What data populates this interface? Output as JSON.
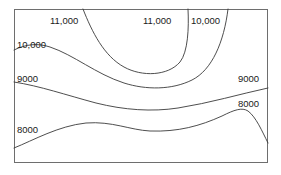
{
  "figure": {
    "width": 281,
    "height": 175,
    "background_color": "#ffffff",
    "frame": {
      "x": 14,
      "y": 9,
      "width": 254,
      "height": 154,
      "stroke_color": "#6e6e6e"
    }
  },
  "chart_data": {
    "type": "line",
    "chart_subtype": "contour-map",
    "title": "",
    "xlabel": "",
    "ylabel": "",
    "grid": false,
    "legend": "none",
    "axis_ticks": "none",
    "contour_line_color": "#3a3a3a",
    "contour_levels": [
      8000,
      9000,
      10000,
      11000
    ],
    "contour_level_labels": [
      "8000",
      "9000",
      "10,000",
      "11,000"
    ],
    "contours": [
      {
        "level": 11000,
        "label": "11,000",
        "shape": "open-u-loop",
        "description": "U-shaped contour open at the top; both branches exit the top edge",
        "enters": "top edge at x=83",
        "exits": "top edge at x=188",
        "trough_point": {
          "x": 150,
          "y": 71
        },
        "path": "M 83 9 C 92 32, 104 56, 124 67 C 142 77, 168 76, 180 62 C 188 52, 189 28, 188 9"
      },
      {
        "level": 10000,
        "label": "10,000",
        "shape": "descending-trough",
        "description": "Enters the left edge, descends to a broad trough across the middle, then rises steeply to exit the top edge on the right",
        "enters": "left edge at y=50",
        "exits": "top edge at x=228",
        "trough_point": {
          "x": 150,
          "y": 88
        },
        "path": "M 14 50 C 26 44, 38 43, 50 47 C 74 55, 96 74, 124 83 C 146 90, 172 90, 192 80 C 212 70, 224 42, 228 9"
      },
      {
        "level": 9000,
        "label": "9000",
        "shape": "gentle-descent",
        "description": "Runs left to right across the figure, sloping gently downward then flattening and rising slightly at the right edge",
        "enters": "left edge at y=82",
        "exits": "right edge at y=88",
        "path": "M 14 82 C 40 86, 66 95, 96 103 C 124 110, 152 112, 178 108 C 210 103, 240 94, 268 88"
      },
      {
        "level": 8000,
        "label": "8000",
        "shape": "wave-with-peak",
        "description": "Rises from the lower-left, forms a gentle crest, dips, then rises to a sharp peak near the right before dropping to the right edge",
        "enters": "left edge at y=148",
        "exits": "right edge at y=143",
        "crest_point": {
          "x": 86,
          "y": 123
        },
        "dip_point": {
          "x": 150,
          "y": 131
        },
        "peak_point": {
          "x": 245,
          "y": 110
        },
        "path": "M 14 148 C 34 140, 58 126, 86 123 C 112 121, 130 130, 150 131 C 178 132, 200 126, 222 116 C 234 110, 242 107, 248 111 C 256 117, 262 131, 268 143"
      }
    ],
    "labels": [
      {
        "text": "11,000",
        "level": 11000,
        "x": 50,
        "y": 21,
        "position": "top-left",
        "anchor": "start"
      },
      {
        "text": "11,000",
        "level": 11000,
        "x": 143,
        "y": 21,
        "position": "top-center",
        "anchor": "start"
      },
      {
        "text": "10,000",
        "level": 10000,
        "x": 191,
        "y": 21,
        "position": "top-right",
        "anchor": "start"
      },
      {
        "text": "10,000",
        "level": 10000,
        "x": 17,
        "y": 45,
        "position": "left-upper",
        "anchor": "start"
      },
      {
        "text": "9000",
        "level": 9000,
        "x": 17,
        "y": 79,
        "position": "left-middle",
        "anchor": "start"
      },
      {
        "text": "9000",
        "level": 9000,
        "x": 238,
        "y": 79,
        "position": "right-middle",
        "anchor": "start"
      },
      {
        "text": "8000",
        "level": 8000,
        "x": 17,
        "y": 130,
        "position": "left-lower",
        "anchor": "start"
      },
      {
        "text": "8000",
        "level": 8000,
        "x": 238,
        "y": 104,
        "position": "right-lower",
        "anchor": "start"
      }
    ]
  }
}
